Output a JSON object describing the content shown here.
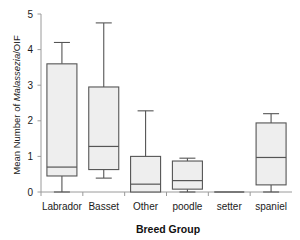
{
  "chart_data": {
    "type": "box",
    "title": "",
    "subtitle": "",
    "xlabel": "Breed Group",
    "ylabel_prefix": "Mean Number of ",
    "ylabel_italic": "Malassezia",
    "ylabel_suffix": "/OIF",
    "ylabel_full": "Mean Number of Malassezia/OIF",
    "categories": [
      "Labrador",
      "Basset",
      "Other",
      "poodle",
      "setter",
      "spaniel"
    ],
    "ylim": [
      0,
      5
    ],
    "xlim": [
      0,
      6
    ],
    "yticks": [
      0,
      1,
      2,
      3,
      4,
      5
    ],
    "ytick_labels": [
      "0",
      "1",
      "2",
      "3",
      "4",
      "5"
    ],
    "grid": false,
    "legend": null,
    "legend_position": "none",
    "box_fill_color": "#eeeeee",
    "box_edge_color": "#555555",
    "axis_color": "#9a9a9a",
    "background_color": "#ffffff",
    "series": [
      {
        "name": "Labrador",
        "whisker_low": 0.0,
        "q1": 0.45,
        "median": 0.7,
        "q3": 3.6,
        "whisker_high": 4.2
      },
      {
        "name": "Basset",
        "whisker_low": 0.39,
        "q1": 0.63,
        "median": 1.28,
        "q3": 2.95,
        "whisker_high": 4.75
      },
      {
        "name": "Other",
        "whisker_low": 0.0,
        "q1": 0.0,
        "median": 0.22,
        "q3": 1.0,
        "whisker_high": 2.28
      },
      {
        "name": "poodle",
        "whisker_low": 0.0,
        "q1": 0.08,
        "median": 0.32,
        "q3": 0.87,
        "whisker_high": 0.95
      },
      {
        "name": "setter",
        "whisker_low": 0.0,
        "q1": 0.0,
        "median": 0.0,
        "q3": 0.0,
        "whisker_high": 0.0
      },
      {
        "name": "spaniel",
        "whisker_low": 0.0,
        "q1": 0.2,
        "median": 0.97,
        "q3": 1.94,
        "whisker_high": 2.2
      }
    ]
  }
}
